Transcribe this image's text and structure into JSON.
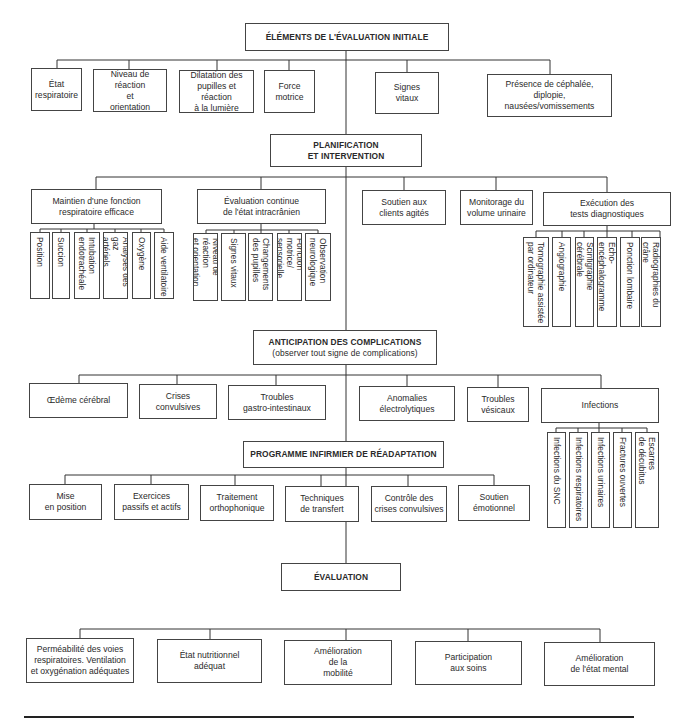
{
  "diagram": {
    "sections": {
      "initial_assessment": {
        "title": "ÉLÉMENTS DE L'ÉVALUATION INITIALE",
        "items": [
          "État\nrespiratoire",
          "Niveau de réaction\net\norientation",
          "Dilatation des\npupilles et réaction\nà la lumière",
          "Force\nmotrice",
          "Signes\nvitaux",
          "Présence de céphalée, diplopie,\nnausées/vomissements"
        ]
      },
      "planning": {
        "title": "PLANIFICATION\nET INTERVENTION",
        "groups": [
          {
            "label": "Maintien d'une fonction\nrespiratoire efficace",
            "children": [
              "Position",
              "Succion",
              "Intubation\nendotrachéale",
              "Analyses des gaz\nartériels",
              "Oxygène",
              "Aide ventilatoire"
            ]
          },
          {
            "label": "Évaluation continue\nde l'état intracrânien",
            "children": [
              "Niveau de réaction\net orientation",
              "Signes vitaux",
              "Changements\ndes pupilles",
              "Fonction motrice/\nsensorielle",
              "Observation\nneurologique"
            ]
          },
          {
            "label": "Soutien aux\nclients agités",
            "children": []
          },
          {
            "label": "Monitorage du\nvolume urinaire",
            "children": []
          },
          {
            "label": "Exécution des\ntests diagnostiques",
            "children": [
              "Tomographie assistée\npar ordinateur",
              "Angiographie",
              "Scintigraphie cérébrale",
              "Écho-encéphalogramme",
              "Ponction lombaire",
              "Radiographies du crâne"
            ]
          }
        ]
      },
      "complications": {
        "title": "ANTICIPATION DES COMPLICATIONS",
        "subtitle": "(observer tout signe de complications)",
        "items": [
          {
            "label": "Œdème cérébral",
            "children": []
          },
          {
            "label": "Crises\nconvulsives",
            "children": []
          },
          {
            "label": "Troubles\ngastro-intestinaux",
            "children": []
          },
          {
            "label": "Anomalies\nélectrolytiques",
            "children": []
          },
          {
            "label": "Troubles\nvésicaux",
            "children": []
          },
          {
            "label": "Infections",
            "children": [
              "Infections du SNC",
              "Infections respiratoires",
              "Infections urinaires",
              "Fractures ouvertes",
              "Escarres\nde décubitus"
            ]
          }
        ]
      },
      "rehabilitation": {
        "title": "PROGRAMME INFIRMIER DE RÉADAPTATION",
        "items": [
          "Mise\nen position",
          "Exercices\npassifs et actifs",
          "Traitement\northophonique",
          "Techniques\nde transfert",
          "Contrôle des\ncrises convulsives",
          "Soutien\némotionnel"
        ]
      },
      "evaluation": {
        "title": "ÉVALUATION",
        "items": [
          "Perméabilité des voies\nrespiratoires. Ventilation\net oxygénation adéquates",
          "État nutritionnel\nadéquat",
          "Amélioration\nde la\nmobilité",
          "Participation\naux soins",
          "Amélioration\nde l'état mental"
        ]
      }
    }
  }
}
